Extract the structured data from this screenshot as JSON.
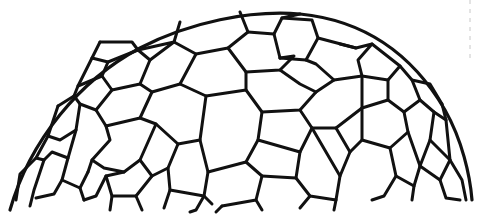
{
  "figure": {
    "description": "Hemispherical dome tiled with irregular hexagons and pentagons, black ink on white",
    "colors": {
      "background": "#ffffff",
      "ink": "#111111",
      "edge_mark": "#c8c8c8"
    },
    "outline": "M 10 210 C 30 140, 80 80, 140 48 C 190 22, 250 10, 300 14 C 360 20, 410 50, 445 110 C 462 140, 470 175, 472 200",
    "edge_mark": {
      "x": 470,
      "y1": 0,
      "y2": 60
    },
    "mesh_paths": [
      "M 100 42 L 92 58 L 108 62 L 138 50",
      "M 138 50 L 132 42 L 100 42",
      "M 180 22 L 174 42 L 138 50",
      "M 174 42 L 196 54 L 228 48 L 248 32 L 240 12",
      "M 248 32 L 274 34 L 282 18 L 300 14",
      "M 282 18 L 312 20 L 318 38 L 306 60 L 280 58",
      "M 274 34 L 280 58",
      "M 228 48 L 246 72 L 280 70 L 294 56 L 280 58",
      "M 196 54 L 180 84 L 206 96 L 246 90 L 246 72",
      "M 318 38 L 356 48 L 372 44 L 358 60 L 362 76 L 334 80 L 316 64 L 306 60",
      "M 356 48 L 340 44",
      "M 372 44 L 400 66 L 388 80 L 362 76",
      "M 400 66 L 412 80 L 430 84 L 442 104",
      "M 412 80 L 420 100 L 404 112 L 388 100 L 388 80",
      "M 108 62 L 102 76 L 78 86 L 74 96",
      "M 92 58 L 78 86",
      "M 138 50 L 150 60 L 140 84 L 112 90 L 102 76",
      "M 150 60 L 174 42",
      "M 140 84 L 152 92 L 180 84",
      "M 152 92 L 140 118 L 106 126 L 96 110 L 112 90",
      "M 74 96 L 80 104 L 96 110",
      "M 58 106 L 74 96",
      "M 58 106 L 48 136 L 60 140 L 76 130 L 80 104",
      "M 48 136 L 36 158 L 44 160 L 52 152 L 68 158 L 76 130",
      "M 106 126 L 110 140 L 92 160 L 88 172",
      "M 140 118 L 156 124 L 178 144 L 200 140 L 206 96",
      "M 156 124 L 140 160 L 124 172 L 104 168 L 92 160",
      "M 178 144 L 168 168 L 170 190 L 204 196 L 208 172 L 200 140",
      "M 140 160 L 152 176 L 168 168",
      "M 124 172 L 106 176 L 96 196 L 84 200",
      "M 106 176 L 112 196 L 136 196 L 152 176",
      "M 68 158 L 62 180 L 80 188 L 88 172",
      "M 62 180 L 54 194 L 36 198",
      "M 80 188 L 84 200",
      "M 36 158 L 20 174 L 16 200",
      "M 44 160 L 34 190 L 30 206",
      "M 112 196 L 110 210",
      "M 136 196 L 142 210",
      "M 246 90 L 262 112 L 300 110 L 316 92 L 334 80",
      "M 280 70 L 300 84 L 316 92",
      "M 262 112 L 258 140 L 300 152 L 312 128 L 300 110",
      "M 208 172 L 246 162 L 258 140",
      "M 246 162 L 262 176 L 256 200 L 222 206",
      "M 262 176 L 296 178 L 300 152",
      "M 296 178 L 310 196 L 336 200 L 340 176 L 312 128",
      "M 340 176 L 350 152 L 362 140 L 362 108 L 362 76",
      "M 362 108 L 388 100",
      "M 312 128 L 336 128 L 350 152",
      "M 336 128 L 362 108",
      "M 362 140 L 390 148 L 408 132 L 404 112",
      "M 390 148 L 396 176 L 414 186 L 420 166 L 408 132",
      "M 420 100 L 434 112 L 430 140 L 420 166",
      "M 434 112 L 446 120 L 450 160 L 440 180 L 420 166",
      "M 430 140 L 450 160",
      "M 442 104 L 446 120",
      "M 396 176 L 384 196 L 372 200",
      "M 414 186 L 412 200",
      "M 440 180 L 446 198 L 460 200",
      "M 450 160 L 462 180 L 466 200",
      "M 336 200 L 334 210",
      "M 310 196 L 300 208",
      "M 256 200 L 262 210",
      "M 222 206 L 216 212",
      "M 204 196 L 196 210 L 190 212",
      "M 204 196 L 212 204",
      "M 170 190 L 164 208"
    ]
  }
}
